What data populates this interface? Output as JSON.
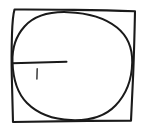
{
  "figure": {
    "background_color": "#ffffff",
    "ink_color": "#1a1a1a",
    "tick_color": "#3a3a3a",
    "canvas": {
      "width": 142,
      "height": 131
    },
    "shapes": [
      {
        "name": "square",
        "label": "Square",
        "stroke_width": 2.1,
        "corners": [
          {
            "x": 14,
            "y": 9
          },
          {
            "x": 135,
            "y": 11
          },
          {
            "x": 131,
            "y": 121
          },
          {
            "x": 13,
            "y": 122
          }
        ],
        "path": "M14.5,9.5 C13.2,14 12.4,22 12.0,34 C11.5,50 11.4,62 11.8,76 C12.2,92 12.6,108 13.0,122.0 C34,121.6 60,121.2 88,120.9 C104,120.7 120,120.6 131.0,120.6 C131.6,108 132.4,92 133.2,74 C133.9,56 134.5,36 135.0,11.2 C116,10.6 96,10.2 74,9.9 C54,9.6 32,9.4 14.5,9.5 Z"
      },
      {
        "name": "circle",
        "label": "Circle",
        "stroke_width": 2.0,
        "center": {
          "x": 72,
          "y": 66
        },
        "radius_x": 61,
        "radius_y": 54,
        "path": "M12.5,62 C12.0,48 16.0,36 24.5,26.5 C34.5,15.5 50.0,11.5 68.0,12.2 C87.0,12.9 104.0,17.0 117.0,27.5 C128.0,36.4 132.5,48.5 132.2,62.5 C131.9,78.0 127.0,93.5 115.5,105.5 C104.5,117.0 88.0,120.8 71.0,120.1 C54.0,119.4 38.0,114.0 27.0,103.0 C16.5,92.5 13.0,77.0 12.5,62 Z"
      },
      {
        "name": "radius-line",
        "label": "Radius line",
        "stroke_width": 2.0,
        "from": {
          "x": 12,
          "y": 63
        },
        "to": {
          "x": 66,
          "y": 62
        },
        "path": "M12.2,63.2 L66.5,61.8"
      },
      {
        "name": "tick-mark",
        "label": "Tick mark",
        "stroke_width": 1.5,
        "from": {
          "x": 37,
          "y": 69
        },
        "to": {
          "x": 37,
          "y": 79
        },
        "path": "M37.2,68.8 L36.9,79.0"
      }
    ]
  }
}
